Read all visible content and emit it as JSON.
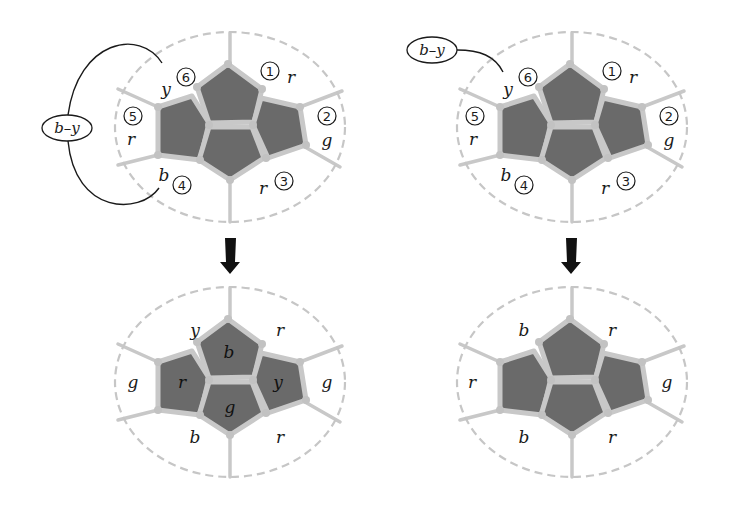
{
  "figure": {
    "panels": [
      {
        "id": "top-left",
        "kempe_label": "b–y",
        "regions": [
          {
            "num": "1",
            "color": "r"
          },
          {
            "num": "2",
            "color": "g"
          },
          {
            "num": "3",
            "color": "r"
          },
          {
            "num": "4",
            "color": "b"
          },
          {
            "num": "5",
            "color": "r"
          },
          {
            "num": "6",
            "color": "y"
          }
        ]
      },
      {
        "id": "top-right",
        "kempe_label": "b–y",
        "regions": [
          {
            "num": "1",
            "color": "r"
          },
          {
            "num": "2",
            "color": "g"
          },
          {
            "num": "3",
            "color": "r"
          },
          {
            "num": "4",
            "color": "b"
          },
          {
            "num": "5",
            "color": "r"
          },
          {
            "num": "6",
            "color": "y"
          }
        ]
      },
      {
        "id": "bottom-left",
        "outer": {
          "top_left": "y",
          "top_right": "r",
          "left": "g",
          "right": "g",
          "bottom_left": "b",
          "bottom_right": "r"
        },
        "inner": {
          "top": "b",
          "left": "r",
          "right": "y",
          "bottom": "g"
        }
      },
      {
        "id": "bottom-right",
        "outer": {
          "top_left": "b",
          "top_right": "r",
          "left": "r",
          "right": "g",
          "bottom_left": "b",
          "bottom_right": "r"
        },
        "inner": {
          "top": "",
          "left": "",
          "right": "",
          "bottom": ""
        }
      }
    ],
    "arrows": [
      {
        "from": "top-left",
        "to": "bottom-left",
        "icon": "down-arrow"
      },
      {
        "from": "top-right",
        "to": "bottom-right",
        "icon": "down-arrow"
      }
    ],
    "colors": {
      "inner_face": "#6a6a6a",
      "border": "#c8c8c8",
      "dashed_outline": "#c6c6c6",
      "ink": "#1a1a1a"
    }
  }
}
